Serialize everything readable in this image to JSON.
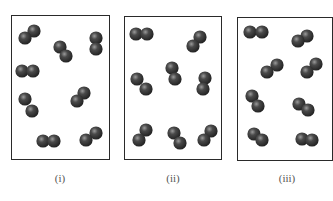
{
  "figure": {
    "colors": {
      "atom_dark": "#1e1e1e",
      "atom_mid": "#4a4a4a",
      "atom_highlight": "#9a9a9a",
      "frame": "#2a2a2a",
      "label": "#555555"
    },
    "atom_radius": 6.6,
    "panels": [
      {
        "label": "(i)",
        "box": {
          "x": 11,
          "y": 15,
          "w": 99,
          "h": 145
        },
        "label_x": 60,
        "molecules": [
          [
            [
              25,
              38
            ],
            [
              34,
              31
            ]
          ],
          [
            [
              60,
              47
            ],
            [
              66,
              56
            ]
          ],
          [
            [
              96,
              38
            ],
            [
              96,
              49
            ]
          ],
          [
            [
              22,
              71
            ],
            [
              33,
              71
            ]
          ],
          [
            [
              25,
              99
            ],
            [
              32,
              111
            ]
          ],
          [
            [
              77,
              101
            ],
            [
              84,
              93
            ]
          ],
          [
            [
              43,
              141
            ],
            [
              54,
              141
            ]
          ],
          [
            [
              86,
              140
            ],
            [
              96,
              133
            ]
          ]
        ]
      },
      {
        "label": "(ii)",
        "box": {
          "x": 124,
          "y": 16,
          "w": 98,
          "h": 144
        },
        "label_x": 173,
        "molecules": [
          [
            [
              136,
              34
            ],
            [
              147,
              34
            ]
          ],
          [
            [
              193,
              46
            ],
            [
              200,
              37
            ]
          ],
          [
            [
              172,
              68
            ],
            [
              175,
              79
            ]
          ],
          [
            [
              137,
              79
            ],
            [
              146,
              89
            ]
          ],
          [
            [
              205,
              78
            ],
            [
              203,
              89
            ]
          ],
          [
            [
              139,
              140
            ],
            [
              146,
              130
            ]
          ],
          [
            [
              174,
              133
            ],
            [
              180,
              143
            ]
          ],
          [
            [
              204,
              140
            ],
            [
              211,
              131
            ]
          ]
        ]
      },
      {
        "label": "(iii)",
        "box": {
          "x": 237,
          "y": 17,
          "w": 96,
          "h": 144
        },
        "label_x": 287,
        "molecules": [
          [
            [
              250,
              32
            ],
            [
              262,
              32
            ]
          ],
          [
            [
              298,
              41
            ],
            [
              307,
              36
            ]
          ],
          [
            [
              267,
              72
            ],
            [
              277,
              65
            ]
          ],
          [
            [
              307,
              72
            ],
            [
              316,
              64
            ]
          ],
          [
            [
              252,
              96
            ],
            [
              258,
              106
            ]
          ],
          [
            [
              299,
              104
            ],
            [
              308,
              110
            ]
          ],
          [
            [
              254,
              134
            ],
            [
              262,
              140
            ]
          ],
          [
            [
              302,
              139
            ],
            [
              312,
              140
            ]
          ]
        ]
      }
    ]
  }
}
